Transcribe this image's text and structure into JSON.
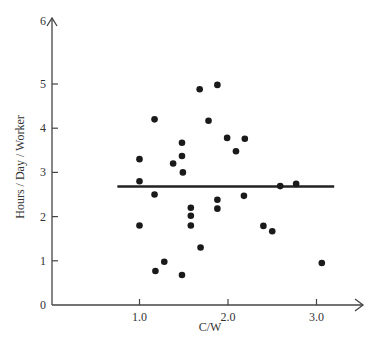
{
  "chart_data": {
    "type": "scatter",
    "title": "",
    "xlabel": "C/W",
    "ylabel": "Hours / Day / Worker",
    "xlim": [
      0,
      3.5
    ],
    "ylim": [
      0,
      6
    ],
    "x_ticks": [
      "1.0",
      "2.0",
      "3.0"
    ],
    "y_ticks": [
      "0",
      "1",
      "2",
      "3",
      "4",
      "5",
      "6"
    ],
    "grid": false,
    "legend": null,
    "points": [
      {
        "x": 1.0,
        "y": 3.3
      },
      {
        "x": 1.0,
        "y": 2.8
      },
      {
        "x": 1.0,
        "y": 1.8
      },
      {
        "x": 1.17,
        "y": 4.2
      },
      {
        "x": 1.17,
        "y": 2.5
      },
      {
        "x": 1.18,
        "y": 0.77
      },
      {
        "x": 1.28,
        "y": 0.98
      },
      {
        "x": 1.38,
        "y": 3.2
      },
      {
        "x": 1.48,
        "y": 3.67
      },
      {
        "x": 1.48,
        "y": 3.37
      },
      {
        "x": 1.49,
        "y": 3.0
      },
      {
        "x": 1.48,
        "y": 0.68
      },
      {
        "x": 1.58,
        "y": 2.2
      },
      {
        "x": 1.58,
        "y": 2.02
      },
      {
        "x": 1.58,
        "y": 1.8
      },
      {
        "x": 1.68,
        "y": 4.88
      },
      {
        "x": 1.69,
        "y": 1.3
      },
      {
        "x": 1.78,
        "y": 4.17
      },
      {
        "x": 1.88,
        "y": 4.98
      },
      {
        "x": 1.88,
        "y": 2.38
      },
      {
        "x": 1.88,
        "y": 2.18
      },
      {
        "x": 1.99,
        "y": 3.78
      },
      {
        "x": 2.09,
        "y": 3.48
      },
      {
        "x": 2.19,
        "y": 3.76
      },
      {
        "x": 2.18,
        "y": 2.47
      },
      {
        "x": 2.4,
        "y": 1.79
      },
      {
        "x": 2.5,
        "y": 1.67
      },
      {
        "x": 2.59,
        "y": 2.69
      },
      {
        "x": 2.77,
        "y": 2.74
      },
      {
        "x": 3.06,
        "y": 0.95
      }
    ],
    "reference_line": {
      "type": "horizontal",
      "y": 2.68,
      "x_start": 0.75,
      "x_end": 3.2
    }
  }
}
